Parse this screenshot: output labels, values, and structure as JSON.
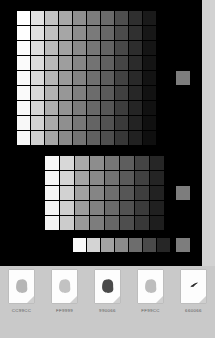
{
  "canvas": {
    "background": "#000000",
    "gutter_color": "#d2d2d2"
  },
  "tray": {
    "background": "#c9c9c9"
  },
  "chart_data": {
    "type": "heatmap",
    "grids": [
      {
        "name": "main-grid",
        "columns": 10,
        "rows": 9,
        "values": [
          [
            "#ffffff",
            "#e2e2e2",
            "#c3c3c3",
            "#a8a8a8",
            "#8f8f8f",
            "#7c7c7c",
            "#6a6a6a",
            "#4e4e4e",
            "#2f2f2f",
            "#1a1a1a"
          ],
          [
            "#ffffff",
            "#e0e0e0",
            "#c0c0c0",
            "#a6a6a6",
            "#8d8d8d",
            "#7a7a7a",
            "#676767",
            "#4b4b4b",
            "#303030",
            "#171717"
          ],
          [
            "#fcfcfc",
            "#dedede",
            "#bcbcbc",
            "#a2a2a2",
            "#8a8a8a",
            "#767676",
            "#636363",
            "#484848",
            "#2d2d2d",
            "#151515"
          ],
          [
            "#fbfbfb",
            "#dcdcdc",
            "#b9b9b9",
            "#9e9e9e",
            "#868686",
            "#737373",
            "#606060",
            "#454545",
            "#2b2b2b",
            "#141414"
          ],
          [
            "#fafafa",
            "#dadada",
            "#b6b6b6",
            "#9b9b9b",
            "#838383",
            "#6f6f6f",
            "#5d5d5d",
            "#424242",
            "#292929",
            "#131313"
          ],
          [
            "#fafafa",
            "#d8d8d8",
            "#b2b2b2",
            "#979797",
            "#7f7f7f",
            "#6c6c6c",
            "#5a5a5a",
            "#404040",
            "#272727",
            "#121212"
          ],
          [
            "#f9f9f9",
            "#d6d6d6",
            "#aeaeae",
            "#939393",
            "#7b7b7b",
            "#686868",
            "#565656",
            "#3d3d3d",
            "#252525",
            "#111111"
          ],
          [
            "#f8f8f8",
            "#d3d3d3",
            "#aaaaaa",
            "#8f8f8f",
            "#777777",
            "#646464",
            "#525252",
            "#3a3a3a",
            "#232323",
            "#101010"
          ],
          [
            "#f7f7f7",
            "#d0d0d0",
            "#a6a6a6",
            "#8a8a8a",
            "#737373",
            "#606060",
            "#4e4e4e",
            "#373737",
            "#212121",
            "#0f0f0f"
          ]
        ]
      },
      {
        "name": "second-grid",
        "columns": 8,
        "rows": 5,
        "values": [
          [
            "#f7f7f7",
            "#d8d8d8",
            "#a9a9a9",
            "#8d8d8d",
            "#767676",
            "#5e5e5e",
            "#444444",
            "#262626"
          ],
          [
            "#f6f6f6",
            "#d5d5d5",
            "#a5a5a5",
            "#898989",
            "#727272",
            "#5a5a5a",
            "#414141",
            "#242424"
          ],
          [
            "#f5f5f5",
            "#d2d2d2",
            "#a1a1a1",
            "#858585",
            "#6e6e6e",
            "#565656",
            "#3e3e3e",
            "#222222"
          ],
          [
            "#f4f4f4",
            "#cfcfcf",
            "#9d9d9d",
            "#818181",
            "#6a6a6a",
            "#525252",
            "#3b3b3b",
            "#202020"
          ],
          [
            "#f3f3f3",
            "#cccccc",
            "#999999",
            "#7d7d7d",
            "#666666",
            "#4e4e4e",
            "#383838",
            "#1e1e1e"
          ]
        ]
      },
      {
        "name": "bottom-strip",
        "columns": 7,
        "rows": 1,
        "values": [
          [
            "#f9f9f9",
            "#d4d4d4",
            "#a3a3a3",
            "#8b8b8b",
            "#6d6d6d",
            "#4a4a4a",
            "#262626"
          ]
        ]
      }
    ],
    "solo_swatches": [
      {
        "name": "solo-swatch-1",
        "color": "#7d7d7d",
        "x": 176,
        "y": 71
      },
      {
        "name": "solo-swatch-2",
        "color": "#7d7d7d",
        "x": 176,
        "y": 186
      },
      {
        "name": "solo-swatch-3",
        "color": "#7d7d7d",
        "x": 176,
        "y": 238
      }
    ]
  },
  "thumbnails": [
    {
      "label": "CC99CC",
      "blob_color": "#b6b6b6",
      "shape": "blob"
    },
    {
      "label": "FF9999",
      "blob_color": "#c2c2c2",
      "shape": "blob"
    },
    {
      "label": "990066",
      "blob_color": "#4a4a4a",
      "shape": "blob"
    },
    {
      "label": "FF99CC",
      "blob_color": "#bdbdbd",
      "shape": "blob"
    },
    {
      "label": "660066",
      "blob_color": "#2e2e2e",
      "shape": "stroke"
    }
  ]
}
